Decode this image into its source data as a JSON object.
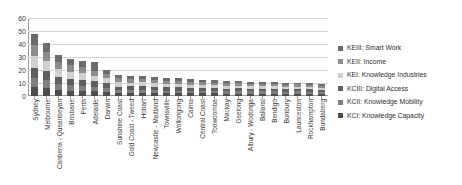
{
  "chart_data": {
    "type": "bar",
    "subtype": "stacked-bar",
    "title": "",
    "xlabel": "",
    "ylabel": "",
    "ylim": [
      0,
      60
    ],
    "ytick_step": 10,
    "ytick_labels": [
      "60",
      "50",
      "40",
      "30",
      "20",
      "10",
      "0"
    ],
    "grid": true,
    "legend_position": "right",
    "categories": [
      "Sydney",
      "Melbourne",
      "Canberra - Queanbeyan",
      "Brisbane",
      "Perth",
      "Adelaide",
      "Darwin",
      "Sunshine Coast",
      "Gold Coast - Tweed",
      "Hobart",
      "Newcastle - Maitland",
      "Townsville",
      "Wollongong",
      "Cairns",
      "Central Coast",
      "Toowoomba",
      "Mackay",
      "Geelong",
      "Albury - Wodonga",
      "Ballarat",
      "Bendigo",
      "Bunbury",
      "Launceston",
      "Rockhampton",
      "Bundaberg"
    ],
    "series": [
      {
        "name": "KCI: Knowledge Capacity",
        "color": "#4d4d4d",
        "values": [
          7.0,
          6.2,
          5.0,
          4.2,
          4.0,
          3.6,
          3.3,
          2.2,
          2.3,
          2.6,
          2.4,
          2.2,
          2.2,
          2.0,
          2.0,
          2.0,
          1.8,
          1.9,
          1.8,
          1.8,
          1.8,
          1.7,
          1.8,
          1.7,
          1.6
        ]
      },
      {
        "name": "KCII: Knowledge Mobility",
        "color": "#7f7f7f",
        "values": [
          6.5,
          5.8,
          4.6,
          4.0,
          3.8,
          3.4,
          3.0,
          2.1,
          2.2,
          2.4,
          2.2,
          2.0,
          2.0,
          1.9,
          1.9,
          1.8,
          1.7,
          1.8,
          1.7,
          1.7,
          1.7,
          1.6,
          1.7,
          1.6,
          1.5
        ]
      },
      {
        "name": "KCIII: Digital Access",
        "color": "#5f5f5f",
        "values": [
          8.0,
          7.0,
          5.4,
          5.0,
          4.6,
          4.2,
          3.6,
          3.0,
          2.9,
          2.8,
          2.7,
          2.6,
          2.5,
          2.4,
          2.3,
          2.2,
          2.1,
          2.1,
          2.0,
          2.0,
          2.0,
          1.9,
          1.9,
          1.8,
          1.7
        ]
      },
      {
        "name": "KEI: Knowledge Industries",
        "color": "#d0d0d0",
        "values": [
          9.5,
          8.0,
          6.0,
          5.4,
          5.0,
          4.4,
          3.8,
          3.2,
          3.0,
          2.9,
          2.8,
          2.6,
          2.5,
          2.4,
          2.3,
          2.2,
          2.1,
          2.0,
          2.0,
          1.9,
          1.9,
          1.8,
          1.8,
          1.7,
          1.6
        ]
      },
      {
        "name": "KEII: Income",
        "color": "#8c8c8c",
        "values": [
          8.0,
          7.0,
          5.2,
          5.0,
          4.6,
          4.0,
          3.5,
          3.0,
          2.8,
          2.7,
          2.6,
          2.5,
          2.4,
          2.3,
          2.2,
          2.1,
          2.0,
          2.0,
          1.9,
          1.9,
          1.8,
          1.8,
          1.7,
          1.6,
          1.5
        ]
      },
      {
        "name": "KEIII: Smart Work",
        "color": "#6b6b6b",
        "values": [
          9.0,
          6.8,
          5.0,
          5.2,
          4.8,
          6.4,
          2.8,
          2.6,
          2.4,
          2.3,
          2.2,
          2.1,
          2.0,
          2.0,
          1.9,
          1.8,
          1.8,
          1.7,
          1.6,
          1.6,
          1.5,
          1.5,
          1.4,
          1.3,
          1.2
        ]
      }
    ],
    "totals": [
      48,
      41,
      31,
      29,
      27,
      26,
      20,
      16,
      16,
      16,
      15,
      14,
      14,
      13,
      13,
      12,
      12,
      12,
      11,
      11,
      11,
      10,
      10,
      10,
      9
    ]
  },
  "legend": {
    "items": [
      {
        "label": "KEIII: Smart Work",
        "color": "#6b6b6b"
      },
      {
        "label": "KEII: Income",
        "color": "#8c8c8c"
      },
      {
        "label": "KEI: Knowledge Industries",
        "color": "#d0d0d0"
      },
      {
        "label": "KCIII: Digital Access",
        "color": "#5f5f5f"
      },
      {
        "label": "KCII: Knowledge Mobility",
        "color": "#7f7f7f"
      },
      {
        "label": "KCI: Knowledge Capacity",
        "color": "#4d4d4d"
      }
    ]
  }
}
